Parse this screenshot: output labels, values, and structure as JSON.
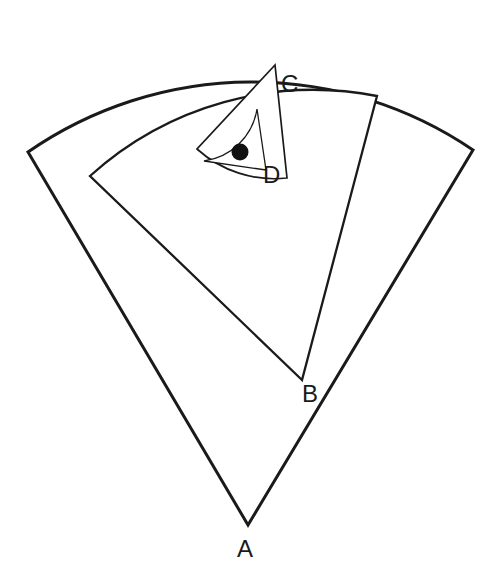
{
  "figure": {
    "kind": "geometry-diagram",
    "background_color": "#ffffff",
    "stroke_color": "#1a1a1a",
    "dot_color": "#111111",
    "width": 497,
    "height": 577
  },
  "labels": [
    {
      "id": "A",
      "text": "A",
      "x": 237,
      "y": 557
    },
    {
      "id": "B",
      "text": "B",
      "x": 302,
      "y": 402
    },
    {
      "id": "C",
      "text": "C",
      "x": 281,
      "y": 92
    },
    {
      "id": "D",
      "text": "D",
      "x": 263,
      "y": 183
    }
  ],
  "chart_data": {
    "type": "diagram",
    "sectors": [
      {
        "name": "sector-A",
        "apex_label": "A",
        "apex": {
          "x": 248,
          "y": 525
        },
        "radius": 393,
        "start_angle_deg": 228,
        "end_angle_deg": 312,
        "arc_start": {
          "x": 28,
          "y": 152
        },
        "arc_end": {
          "x": 473,
          "y": 150
        },
        "arc_top": {
          "x": 250,
          "y": 36
        },
        "stroke_width": 3.0
      },
      {
        "name": "sector-B",
        "apex_label": "B",
        "apex": {
          "x": 302,
          "y": 380
        },
        "radius": 333,
        "start_angle_deg": 219,
        "end_angle_deg": 306,
        "arc_start": {
          "x": 90,
          "y": 176
        },
        "arc_end": {
          "x": 377,
          "y": 96
        },
        "arc_top": {
          "x": 250,
          "y": 60
        },
        "stroke_width": 2.3
      },
      {
        "name": "sector-C",
        "apex_label": "C",
        "apex": {
          "x": 275,
          "y": 65
        },
        "radius": 115,
        "start_angle_deg": 133,
        "end_angle_deg": 218,
        "arc_start": {
          "x": 197,
          "y": 149
        },
        "arc_end": {
          "x": 287,
          "y": 178
        },
        "stroke_width": 1.7
      },
      {
        "name": "sector-D",
        "apex_label": "D",
        "apex": {
          "x": 266,
          "y": 170
        },
        "radius": 62,
        "start_angle_deg": 172,
        "end_angle_deg": 262,
        "arc_start": {
          "x": 204,
          "y": 161
        },
        "arc_end": {
          "x": 257,
          "y": 109
        },
        "stroke_width": 1.3
      }
    ],
    "points": [
      {
        "name": "centre-dot",
        "x": 240,
        "y": 152,
        "radius": 8.5,
        "filled": true,
        "color": "#111111"
      }
    ],
    "annotations": [
      "A",
      "B",
      "C",
      "D"
    ],
    "grid": false,
    "legend": false
  },
  "geometry_paths": {
    "sector_a": "M 248 525 L 28 152 A 393 393 0 0 1 473 150 Z",
    "sector_b": "M 302 380 L 90 176 A 333 333 0 0 1 377 96 Z",
    "sector_c": "M 275 65 L 197 149 A 115 115 0 0 0 287 178 Z",
    "sector_d": "M 266 170 L 204 161 A 62 62 0 0 0 257 109 Z",
    "dot": {
      "cx": 240,
      "cy": 152,
      "r": 8.5
    }
  }
}
